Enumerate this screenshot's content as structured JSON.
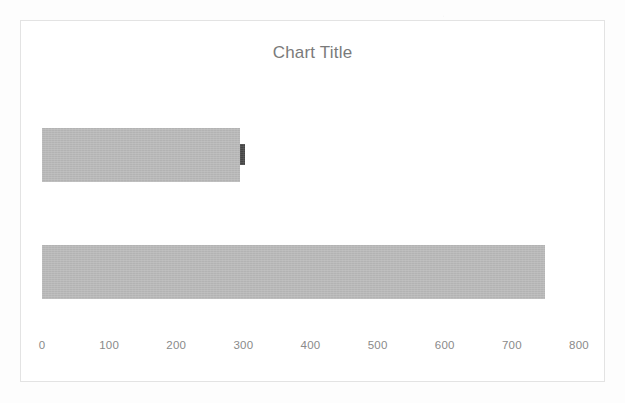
{
  "chart": {
    "title": "Chart Title",
    "frame": {
      "border_color": "#e3e3e3",
      "background": "#ffffff"
    }
  },
  "colors": {
    "title": "#7a7a7a",
    "tick_label": "#8a8a8a",
    "series_primary": "#474747",
    "series_secondary": "#b9b9b9",
    "plot_background": "#ffffff",
    "page_background": "#fdfdfd"
  },
  "chart_data": {
    "type": "bar",
    "orientation": "horizontal",
    "title": "Chart Title",
    "xlabel": "",
    "ylabel": "",
    "xlim": [
      0,
      800
    ],
    "ylim": null,
    "grid": false,
    "legend": false,
    "legend_position": "none",
    "categories": [
      "Category 1",
      "Category 2"
    ],
    "category_labels_visible": false,
    "axis": {
      "ticks": [
        0,
        100,
        200,
        300,
        400,
        500,
        600,
        700,
        800
      ],
      "tick_labels": [
        "0",
        "100",
        "200",
        "300",
        "400",
        "500",
        "600",
        "700",
        "800"
      ],
      "tick_interval": 100,
      "axis_line_visible": false
    },
    "series": [
      {
        "name": "Series 2",
        "color": "#b9b9b9",
        "render": "back-wide",
        "values": [
          295,
          750
        ]
      },
      {
        "name": "Series 1",
        "color": "#474747",
        "render": "front-narrow",
        "values": [
          302,
          750
        ]
      }
    ]
  }
}
